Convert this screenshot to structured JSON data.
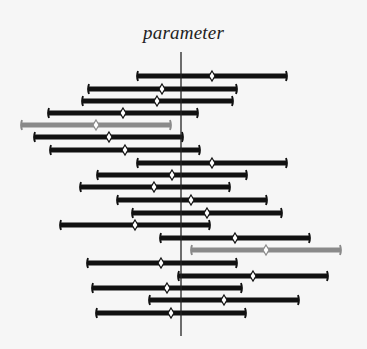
{
  "chart_data": {
    "type": "interval",
    "title": "parameter",
    "xlabel": "",
    "ylabel": "",
    "grid": false,
    "legend": null,
    "reference_line": {
      "x_px": 181,
      "y_top_px": 52,
      "y_bottom_px": 336,
      "label": "true parameter value"
    },
    "colors": {
      "captures": "#111111",
      "misses": "#8a8a8a",
      "estimate_fill": "#ffffff"
    },
    "intervals": [
      {
        "index": 1,
        "y": 76,
        "lower": 136,
        "upper": 288,
        "estimate": 212,
        "captures": true
      },
      {
        "index": 2,
        "y": 89,
        "lower": 87,
        "upper": 238,
        "estimate": 162,
        "captures": true
      },
      {
        "index": 3,
        "y": 101,
        "lower": 81,
        "upper": 234,
        "estimate": 157,
        "captures": true
      },
      {
        "index": 4,
        "y": 113,
        "lower": 47,
        "upper": 199,
        "estimate": 123,
        "captures": true
      },
      {
        "index": 5,
        "y": 125,
        "lower": 20,
        "upper": 172,
        "estimate": 96,
        "captures": false
      },
      {
        "index": 6,
        "y": 137,
        "lower": 33,
        "upper": 184,
        "estimate": 109,
        "captures": true
      },
      {
        "index": 7,
        "y": 150,
        "lower": 49,
        "upper": 201,
        "estimate": 125,
        "captures": true
      },
      {
        "index": 8,
        "y": 163,
        "lower": 136,
        "upper": 288,
        "estimate": 212,
        "captures": true
      },
      {
        "index": 9,
        "y": 175,
        "lower": 96,
        "upper": 248,
        "estimate": 172,
        "captures": true
      },
      {
        "index": 10,
        "y": 187,
        "lower": 79,
        "upper": 231,
        "estimate": 154,
        "captures": true
      },
      {
        "index": 11,
        "y": 200,
        "lower": 116,
        "upper": 268,
        "estimate": 191,
        "captures": true
      },
      {
        "index": 12,
        "y": 213,
        "lower": 131,
        "upper": 283,
        "estimate": 207,
        "captures": true
      },
      {
        "index": 13,
        "y": 225,
        "lower": 59,
        "upper": 211,
        "estimate": 135,
        "captures": true
      },
      {
        "index": 14,
        "y": 238,
        "lower": 159,
        "upper": 311,
        "estimate": 235,
        "captures": true
      },
      {
        "index": 15,
        "y": 250,
        "lower": 190,
        "upper": 342,
        "estimate": 266,
        "captures": false
      },
      {
        "index": 16,
        "y": 263,
        "lower": 86,
        "upper": 238,
        "estimate": 161,
        "captures": true
      },
      {
        "index": 17,
        "y": 276,
        "lower": 177,
        "upper": 329,
        "estimate": 253,
        "captures": true
      },
      {
        "index": 18,
        "y": 288,
        "lower": 91,
        "upper": 243,
        "estimate": 167,
        "captures": true
      },
      {
        "index": 19,
        "y": 300,
        "lower": 148,
        "upper": 300,
        "estimate": 224,
        "captures": true
      },
      {
        "index": 20,
        "y": 313,
        "lower": 95,
        "upper": 247,
        "estimate": 171,
        "captures": true
      }
    ]
  }
}
